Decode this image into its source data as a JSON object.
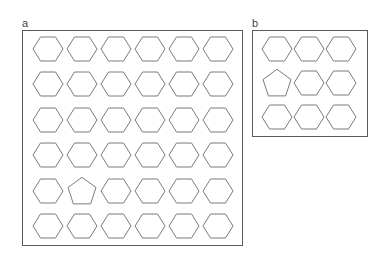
{
  "panels": [
    {
      "id": "a",
      "label": "a",
      "frame": {
        "x": 22,
        "y": 30,
        "w": 221,
        "h": 216
      },
      "rows": 6,
      "cols": 6,
      "col_centers": [
        48,
        82,
        116,
        150,
        184,
        218
      ],
      "row_centers": [
        49,
        84,
        120,
        155,
        191,
        226
      ],
      "odd_one": {
        "row": 4,
        "col": 1,
        "shape": "pentagon"
      },
      "default_shape": "hexagon"
    },
    {
      "id": "b",
      "label": "b",
      "frame": {
        "x": 252,
        "y": 30,
        "w": 116,
        "h": 107
      },
      "rows": 3,
      "cols": 3,
      "col_centers": [
        277,
        309,
        341
      ],
      "row_centers": [
        49,
        83,
        117
      ],
      "odd_one": {
        "row": 1,
        "col": 0,
        "shape": "pentagon"
      },
      "default_shape": "hexagon"
    }
  ],
  "style": {
    "shape_stroke": "#7a7a7a",
    "frame_stroke": "#5a5a5a",
    "shape_radius": 15
  }
}
